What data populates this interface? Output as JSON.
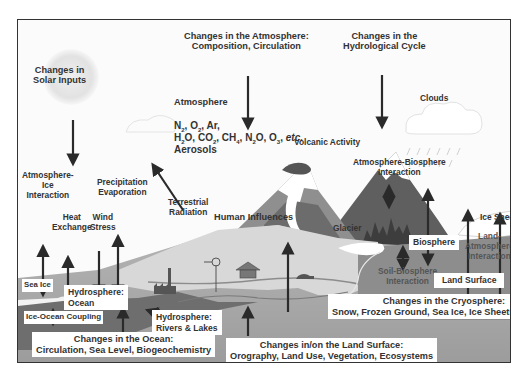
{
  "diagram": {
    "title_labels": {
      "solar": [
        "Changes in",
        "Solar Inputs"
      ],
      "atmosphere_changes": [
        "Changes in the Atmosphere:",
        "Composition, Circulation"
      ],
      "hydro_cycle": [
        "Changes in the",
        "Hydrological Cycle"
      ]
    },
    "atmosphere": {
      "label": "Atmosphere",
      "gases_line1": "N₂, O₂, Ar,",
      "gases_line2": "H₂O, CO₂, CH₄, N₂O, O₃, etc.",
      "aerosols": "Aerosols"
    },
    "clouds": "Clouds",
    "volcanic": "Volcanic Activity",
    "terrestrial_radiation": [
      "Terrestrial",
      "Radiation"
    ],
    "human_influences": "Human Influences",
    "atm_ice": [
      "Atmosphere-",
      "Ice",
      "Interaction"
    ],
    "heat_exchange": [
      "Heat",
      "Exchange"
    ],
    "wind_stress": [
      "Wind",
      "Stress"
    ],
    "precip_evap": [
      "Precipitation",
      "Evaporation"
    ],
    "atm_bio": [
      "Atmosphere-Biosphere",
      "Interaction"
    ],
    "glacier": "Glacier",
    "ice_sheet": "Ice Sheet",
    "biosphere": "Biosphere",
    "land_atm": [
      "Land-",
      "Atmosphere",
      "Interaction"
    ],
    "soil_bio": [
      "Soil-Biosphere",
      "Interaction"
    ],
    "land_surface": "Land Surface",
    "sea_ice": "Sea Ice",
    "hydro_ocean": [
      "Hydrosphere:",
      "Ocean"
    ],
    "ice_ocean": "Ice-Ocean Coupling",
    "hydro_rivers": [
      "Hydrosphere:",
      "Rivers & Lakes"
    ],
    "ocean_changes": [
      "Changes in the Ocean:",
      "Circulation, Sea Level, Biogeochemistry"
    ],
    "land_changes": [
      "Changes in/on the Land Surface:",
      "Orography, Land Use, Vegetation, Ecosystems"
    ],
    "cryo_changes": [
      "Changes in the Cryosphere:",
      "Snow, Frozen Ground, Sea Ice, Ice Sheets, Glaciers"
    ],
    "colors": {
      "border": "#333333",
      "background": "#fbfbfb",
      "ocean": "#6e6e6e",
      "land": "#a9a9a9",
      "plain": "#d6d6d6",
      "mountain_dark": "#5a5a5a",
      "mountain_mid": "#8a8a8a",
      "arrow": "#2a2a2a"
    }
  }
}
